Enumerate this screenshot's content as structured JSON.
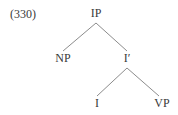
{
  "figure": {
    "example_number": "(330)",
    "background_color": "#ffffff",
    "line_color": "#8c8c8c",
    "text_color": "#3a3a3a",
    "width": 178,
    "height": 115
  },
  "tree": {
    "nodes": [
      {
        "id": "ip",
        "label": "IP",
        "x": 96,
        "y": 14
      },
      {
        "id": "np",
        "label": "NP",
        "x": 63,
        "y": 59
      },
      {
        "id": "ibar",
        "label": "I′",
        "x": 127,
        "y": 59
      },
      {
        "id": "i",
        "label": "I",
        "x": 97,
        "y": 104
      },
      {
        "id": "vp",
        "label": "VP",
        "x": 162,
        "y": 104
      }
    ],
    "edges": [
      {
        "from": "ip",
        "to": "np",
        "x1": 96,
        "y1": 23,
        "x2": 63,
        "y2": 51
      },
      {
        "from": "ip",
        "to": "ibar",
        "x1": 96,
        "y1": 23,
        "x2": 127,
        "y2": 51
      },
      {
        "from": "ibar",
        "to": "i",
        "x1": 127,
        "y1": 68,
        "x2": 97,
        "y2": 96
      },
      {
        "from": "ibar",
        "to": "vp",
        "x1": 127,
        "y1": 68,
        "x2": 159,
        "y2": 96
      }
    ]
  }
}
